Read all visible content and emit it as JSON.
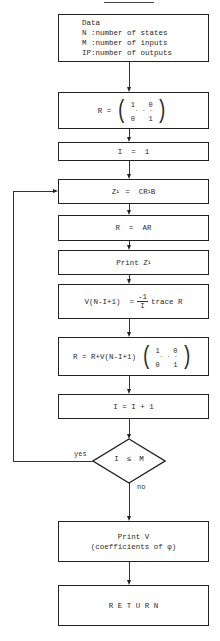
{
  "title": "FORTRAN",
  "boxes": {
    "data": {
      "heading": "Data",
      "lines": [
        "N :number of states",
        "M :number of inputs",
        "IP:number of outputs"
      ]
    },
    "init_r": {
      "lhs": "R =",
      "m11": "1",
      "m12": "0",
      "m21": "0",
      "m22": "1",
      "dots": "·  ·  ·"
    },
    "init_i": {
      "text": "I  =  1"
    },
    "zi": {
      "z": "Z",
      "sub": "i",
      "eq": "=  CR",
      "sub2": "i",
      "b": "B"
    },
    "r_ar": {
      "text": "R  =  AR"
    },
    "print_zi": {
      "text": "Print Z",
      "sub": "i"
    },
    "v_calc": {
      "lhs": "V(N-I+1)  =",
      "num": "-1",
      "den": "I",
      "rhs": "trace R"
    },
    "r_update": {
      "lhs": "R = R+V(N-I+1)",
      "m11": "1",
      "m12": "0",
      "m21": "0",
      "m22": "1",
      "dots": "·  ·  ·"
    },
    "i_inc": {
      "text": "I = I + 1"
    },
    "print_v": {
      "line1": "Print V",
      "line2": "(coefficients of φ)"
    },
    "return": {
      "text": "R E T U R N"
    }
  },
  "decision": {
    "left": "I",
    "op": "≤",
    "right": "M",
    "yes_label": "yes",
    "no_label": "no"
  }
}
